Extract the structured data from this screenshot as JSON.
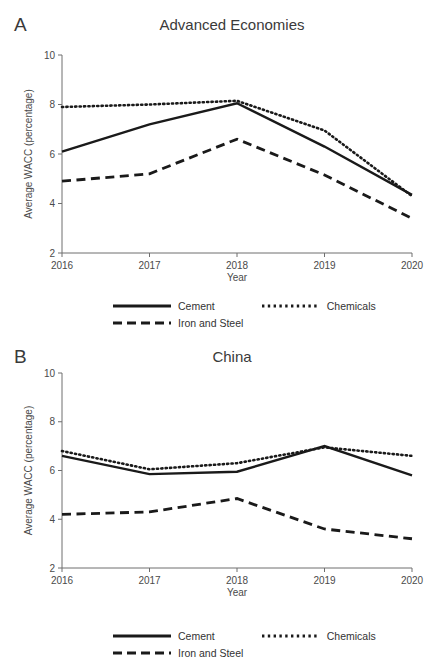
{
  "figure": {
    "background": "#ffffff",
    "line_color": "#1a1a1a",
    "axis_color": "#6e6e6e",
    "text_color": "#3a3a3a"
  },
  "panels": [
    {
      "letter": "A",
      "title": "Advanced Economies"
    },
    {
      "letter": "B",
      "title": "China"
    }
  ],
  "legend": {
    "entries": [
      {
        "label": "Cement",
        "style": "solid"
      },
      {
        "label": "Chemicals",
        "style": "dotted"
      },
      {
        "label": "Iron and Steel",
        "style": "dashed"
      }
    ]
  },
  "chart_data": [
    {
      "type": "line",
      "panel": "A",
      "title": "Advanced Economies",
      "xlabel": "Year",
      "ylabel": "Average WACC (percentage)",
      "categories": [
        "2016",
        "2017",
        "2018",
        "2019",
        "2020"
      ],
      "x": [
        2016,
        2017,
        2018,
        2019,
        2020
      ],
      "xlim": [
        2016,
        2020
      ],
      "ylim": [
        2,
        10
      ],
      "yticks": [
        2,
        4,
        6,
        8,
        10
      ],
      "xticks": [
        2016,
        2017,
        2018,
        2019,
        2020
      ],
      "grid": false,
      "legend_position": "below",
      "series": [
        {
          "name": "Cement",
          "style": "solid",
          "values": [
            6.1,
            7.2,
            8.05,
            6.3,
            4.35
          ]
        },
        {
          "name": "Chemicals",
          "style": "dotted",
          "values": [
            7.9,
            8.0,
            8.15,
            6.95,
            4.3
          ]
        },
        {
          "name": "Iron and Steel",
          "style": "dashed",
          "values": [
            4.9,
            5.2,
            6.6,
            5.15,
            3.4
          ]
        }
      ]
    },
    {
      "type": "line",
      "panel": "B",
      "title": "China",
      "xlabel": "Year",
      "ylabel": "Average WACC (percentage)",
      "categories": [
        "2016",
        "2017",
        "2018",
        "2019",
        "2020"
      ],
      "x": [
        2016,
        2017,
        2018,
        2019,
        2020
      ],
      "xlim": [
        2016,
        2020
      ],
      "ylim": [
        2,
        10
      ],
      "yticks": [
        2,
        4,
        6,
        8,
        10
      ],
      "xticks": [
        2016,
        2017,
        2018,
        2019,
        2020
      ],
      "grid": false,
      "legend_position": "below",
      "series": [
        {
          "name": "Cement",
          "style": "solid",
          "values": [
            6.6,
            5.85,
            5.95,
            7.0,
            5.8
          ]
        },
        {
          "name": "Chemicals",
          "style": "dotted",
          "values": [
            6.8,
            6.05,
            6.3,
            6.95,
            6.6
          ]
        },
        {
          "name": "Iron and Steel",
          "style": "dashed",
          "values": [
            4.2,
            4.3,
            4.85,
            3.6,
            3.2
          ]
        }
      ]
    }
  ]
}
